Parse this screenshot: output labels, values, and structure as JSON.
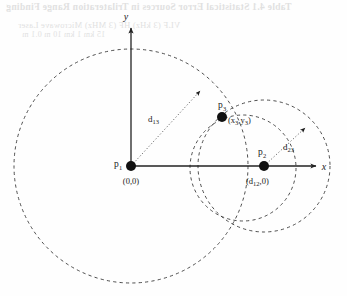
{
  "figure": {
    "caption_bleed": {
      "title": "Table 4.1  Statistical Error Sources in Trilateration Range Finding",
      "row_a": "VLF (3 kHz)        HF (3 MHz)        Microwave        Laser",
      "row_b": "15 km               1 km                  10 m              0.1 m"
    },
    "axes": {
      "y_label": "y",
      "x_label": "x",
      "origin_x": 131,
      "origin_y": 166
    },
    "points": [
      {
        "id": "p1",
        "label": "p",
        "subscript": "1",
        "coord_label": "(0,0)",
        "cx": 131,
        "cy": 166,
        "r": 5.0
      },
      {
        "id": "p2",
        "label": "p",
        "subscript": "2",
        "coord_label": "(d12,0)",
        "coord_base": "(d",
        "coord_sub": "12",
        "coord_tail": ",0)",
        "cx": 264,
        "cy": 166,
        "r": 5.0
      },
      {
        "id": "p3",
        "label": "p",
        "subscript": "3",
        "coord_label": "(x3,y3)",
        "coord_x_base": "(x",
        "coord_x_sub": "3",
        "coord_comma": ",y",
        "coord_y_sub": "3",
        "coord_tail": ")",
        "cx": 222,
        "cy": 117,
        "r": 5.0
      }
    ],
    "circles": [
      {
        "id": "circle-p1",
        "cx": 131,
        "cy": 166,
        "r": 117
      },
      {
        "id": "circle-p2-outer",
        "cx": 264,
        "cy": 166,
        "r": 66
      },
      {
        "id": "circle-p3-mid",
        "cx": 243,
        "cy": 168,
        "r": 53
      }
    ],
    "distances": [
      {
        "id": "d13",
        "base": "d",
        "subscript": "13",
        "label": "d13",
        "from_x": 131,
        "from_y": 166,
        "to_x": 200,
        "to_y": 91,
        "label_x": 154,
        "label_y": 119
      },
      {
        "id": "d23",
        "base": "d",
        "subscript": "23",
        "label": "d23",
        "from_x": 264,
        "from_y": 166,
        "to_x": 305,
        "to_y": 128,
        "label_x": 288,
        "label_y": 148
      }
    ],
    "colors": {
      "stroke": "#222222",
      "dashed": "#3a3a3a",
      "dotted": "#555555",
      "background": "#fefefe",
      "bleed": "#c9c9c9"
    }
  }
}
